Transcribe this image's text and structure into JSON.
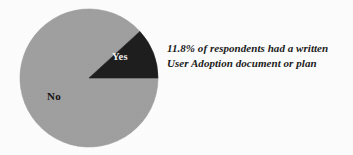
{
  "chart_data": {
    "type": "pie",
    "title": "",
    "subtitle": "",
    "xlabel": "",
    "ylabel": "",
    "legend_position": "none",
    "grid": false,
    "labels_on_slices": true,
    "categories": [
      "Yes",
      "No"
    ],
    "values": [
      11.8,
      88.2
    ],
    "value_unit": "%",
    "slices": [
      {
        "label": "Yes",
        "value": 11.8,
        "color": "#1e1e1e",
        "label_color": "#f4f4f4",
        "start_angle_deg": 0,
        "sweep_deg": 42.5
      },
      {
        "label": "No",
        "value": 88.2,
        "color": "#a0a0a0",
        "label_color": "#141414",
        "start_angle_deg": 42.5,
        "sweep_deg": 317.5
      }
    ],
    "annotations": [
      "11.8% of respondents had a written",
      "User Adoption document or plan"
    ]
  },
  "figure": {
    "background_color": "#fdfdfd",
    "pie": {
      "center_x": 89,
      "center_y": 78,
      "radius": 69,
      "outline_color": "#8f8f8f",
      "slice_yes_label": "Yes",
      "slice_no_label": "No"
    },
    "annotation": {
      "line1": "11.8% of respondents had a written",
      "line2": "User Adoption document or plan",
      "color": "#1b1b1b"
    }
  }
}
